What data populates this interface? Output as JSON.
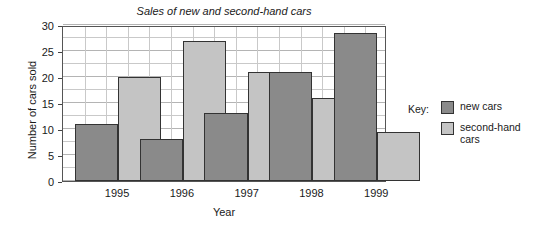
{
  "chart_data": {
    "type": "bar",
    "title": "Sales of new and second-hand cars",
    "xlabel": "Year",
    "ylabel": "Number of cars sold",
    "categories": [
      "1995",
      "1996",
      "1997",
      "1998",
      "1999"
    ],
    "series": [
      {
        "name": "new cars",
        "color": "#8a8a8a",
        "values": [
          11,
          8,
          13,
          21,
          28.5
        ]
      },
      {
        "name": "second-hand cars",
        "color": "#c4c4c4",
        "values": [
          20,
          27,
          21,
          16,
          9.5
        ]
      }
    ],
    "ylim": [
      0,
      30
    ],
    "ytick_labels": [
      "0",
      "5",
      "10",
      "15",
      "20",
      "25",
      "30"
    ],
    "ytick_values": [
      0,
      5,
      10,
      15,
      20,
      25,
      30
    ],
    "minor_y_step": 2.5,
    "grid": true,
    "legend_position": "right"
  },
  "legend": {
    "key_label": "Key:",
    "entries": [
      {
        "label": "new cars",
        "color": "#8a8a8a"
      },
      {
        "label": "second-hand cars",
        "color": "#c4c4c4"
      }
    ]
  }
}
